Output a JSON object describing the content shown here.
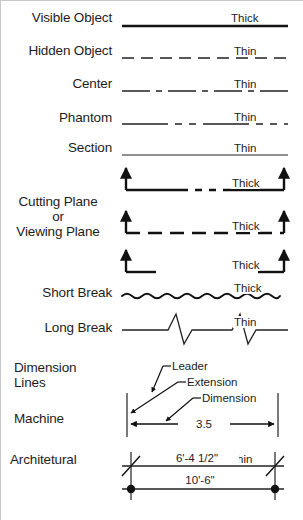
{
  "sheet": {
    "title": "Line Types Reference Chart",
    "background_color": "#ffffff",
    "ink_color": "#1a1a1a",
    "border_color": "#c9c9c9",
    "width": 303,
    "height": 520
  },
  "rows": [
    {
      "id": "visible-object",
      "label": "Visible Object",
      "weight": "Thick",
      "linetype": "continuous-thick",
      "stroke_width": 2.4,
      "description": "Solid continuous thick line"
    },
    {
      "id": "hidden-object",
      "label": "Hidden Object",
      "weight": "Thin",
      "linetype": "dashed-even",
      "stroke_width": 1.5,
      "dash_pattern": "11 7",
      "description": "Evenly spaced short dashes"
    },
    {
      "id": "center",
      "label": "Center",
      "weight": "Thin",
      "linetype": "long-short-long",
      "stroke_width": 1.2,
      "dash_pattern": "26 6 6 6",
      "description": "Alternating long and short dashes"
    },
    {
      "id": "phantom",
      "label": "Phantom",
      "weight": "Thin",
      "linetype": "long-short-short-long",
      "stroke_width": 1.2,
      "dash_pattern": "40 7 7 7 7 7",
      "description": "Long dash followed by two short dashes"
    },
    {
      "id": "section",
      "label": "Section",
      "weight": "Thin",
      "linetype": "continuous-thin",
      "stroke_width": 1.2,
      "description": "Solid continuous thin line"
    },
    {
      "id": "cutting-plane",
      "label": "Cutting Plane\nor\nViewing Plane",
      "label_lines": [
        "Cutting Plane",
        "or",
        "Viewing Plane"
      ],
      "weight": "Thick",
      "variants": [
        {
          "id": "cutting-plane-variant-a",
          "weight": "Thick",
          "linetype": "long-short-short-long-with-arrows",
          "dash_pattern": "58 7 7 7 7 7",
          "stroke_width": 2.4
        },
        {
          "id": "cutting-plane-variant-b",
          "weight": "Thick",
          "linetype": "dashed-even-with-arrows",
          "dash_pattern": "13 8",
          "stroke_width": 2.4
        },
        {
          "id": "cutting-plane-variant-c",
          "weight": "Thick",
          "linetype": "end-stubs-with-arrows",
          "stroke_width": 2.4
        }
      ]
    },
    {
      "id": "short-break",
      "label": "Short Break",
      "weight": "Thick",
      "linetype": "freehand-wavy",
      "stroke_width": 1.9,
      "description": "Freehand wavy break line"
    },
    {
      "id": "long-break",
      "label": "Long Break",
      "weight": "Thin",
      "linetype": "ruled-with-zigzag",
      "stroke_width": 1.2,
      "zigzag_count": 2,
      "description": "Ruled line with zig-zag break symbols"
    },
    {
      "id": "dimension-lines",
      "label": "Dimension\nLines",
      "label_lines": [
        "Dimension",
        "Lines"
      ],
      "weight": "",
      "linetype": "group-header"
    },
    {
      "id": "machine",
      "label": "Machine",
      "weight": "",
      "linetype": "dimension-machine",
      "dimension_text": "3.5",
      "terminator": "filled-arrowhead"
    },
    {
      "id": "architetural",
      "label": "Architetural",
      "weight": "Thin",
      "linetype": "dimension-architectural",
      "dimensions": [
        {
          "id": "arch-dim-upper",
          "text": "6'-4 1/2\"",
          "terminator": "slash-tick",
          "weight": "Thin"
        },
        {
          "id": "arch-dim-lower",
          "text": "10'-6\"",
          "terminator": "filled-dot",
          "weight": ""
        }
      ]
    }
  ],
  "annotations": [
    {
      "id": "leader",
      "text": "Leader",
      "points_to": "extension-line-top"
    },
    {
      "id": "extension",
      "text": "Extension",
      "points_to": "extension-line-bottom"
    },
    {
      "id": "dimension",
      "text": "Dimension",
      "points_to": "dimension-line"
    }
  ],
  "weights": {
    "thick": "Thick",
    "thin": "Thin"
  }
}
